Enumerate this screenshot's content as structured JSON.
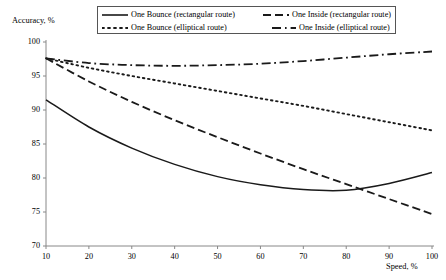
{
  "chart_data": {
    "type": "line",
    "title": "",
    "xlabel": "Speed, %",
    "ylabel": "Accuracy, %",
    "xlim": [
      10,
      100
    ],
    "ylim": [
      70,
      100
    ],
    "xticks": [
      10,
      20,
      30,
      40,
      50,
      60,
      70,
      80,
      90,
      100
    ],
    "yticks": [
      70,
      75,
      80,
      85,
      90,
      95,
      100
    ],
    "grid": false,
    "legend_position": "top-center",
    "x": [
      10,
      20,
      30,
      40,
      50,
      60,
      70,
      80,
      90,
      100
    ],
    "series": [
      {
        "name": "One Bounce (rectangular route)",
        "style": "solid",
        "color": "#1a1a1a",
        "values": [
          91.5,
          87.5,
          84.4,
          82.0,
          80.2,
          79.0,
          78.3,
          78.2,
          79.2,
          80.8
        ]
      },
      {
        "name": "One Inside (rectangular route)",
        "style": "dashed",
        "color": "#1a1a1a",
        "values": [
          97.6,
          94.2,
          91.2,
          88.5,
          86.0,
          83.6,
          81.3,
          79.1,
          76.9,
          74.7
        ]
      },
      {
        "name": "One Bounce (elliptical route)",
        "style": "dotted",
        "color": "#1a1a1a",
        "values": [
          97.6,
          96.2,
          95.0,
          93.9,
          92.8,
          91.7,
          90.6,
          89.4,
          88.2,
          87.0
        ]
      },
      {
        "name": "One Inside (elliptical route)",
        "style": "dashdot",
        "color": "#1a1a1a",
        "values": [
          97.6,
          96.9,
          96.6,
          96.5,
          96.6,
          96.8,
          97.2,
          97.7,
          98.2,
          98.6
        ]
      }
    ]
  },
  "legend": {
    "entries": [
      {
        "label": "One Bounce (rectangular route)",
        "style": "solid"
      },
      {
        "label": "One Inside (rectangular route)",
        "style": "dashed"
      },
      {
        "label": "One Bounce (elliptical route)",
        "style": "dotted"
      },
      {
        "label": "One Inside (elliptical route)",
        "style": "dashdot"
      }
    ]
  }
}
